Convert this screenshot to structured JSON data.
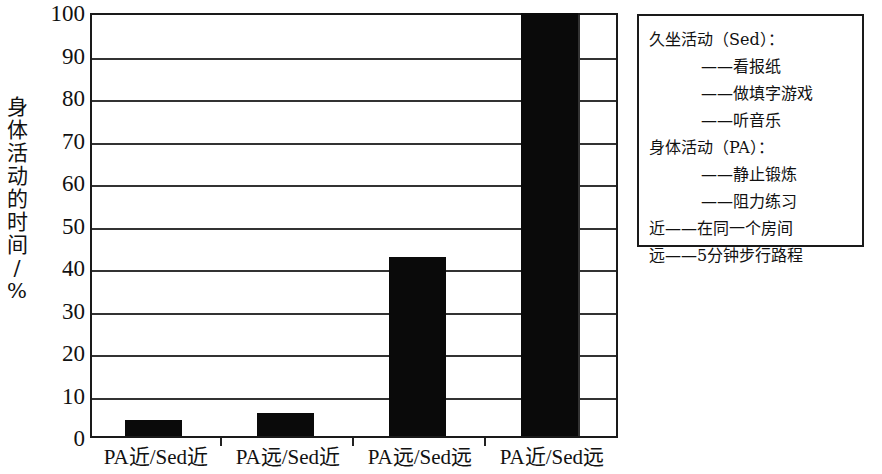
{
  "chart_data": {
    "type": "bar",
    "title": "",
    "xlabel": "",
    "ylabel": "身体活动的时间/%",
    "ylim": [
      0,
      100
    ],
    "ytick_step": 10,
    "grid": true,
    "bar_color": "#0a0a0a",
    "categories": [
      "PA近/Sed近",
      "PA远/Sed近",
      "PA远/Sed远",
      "PA近/Sed远"
    ],
    "values": [
      4.3,
      6.0,
      42.5,
      100
    ],
    "yticks": [
      "100",
      "90",
      "80",
      "70",
      "60",
      "50",
      "40",
      "30",
      "20",
      "10",
      "0"
    ],
    "legend_position": "right",
    "legend_entries": [
      {
        "text": "久坐活动（Sed）：",
        "indent": false
      },
      {
        "text": "——看报纸",
        "indent": true
      },
      {
        "text": "——做填字游戏",
        "indent": true
      },
      {
        "text": "——听音乐",
        "indent": true
      },
      {
        "text": "身体活动（PA）：",
        "indent": false
      },
      {
        "text": "——静止锻炼",
        "indent": true
      },
      {
        "text": "——阻力练习",
        "indent": true
      },
      {
        "text": "近——在同一个房间",
        "indent": false
      },
      {
        "text": "远——5分钟步行路程",
        "indent": false
      }
    ]
  },
  "axis": {
    "y_title_stacked": "身\n体\n活\n动\n的\n时\n间\n/\n%"
  }
}
